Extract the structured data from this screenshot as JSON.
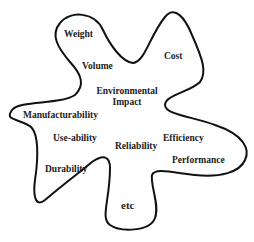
{
  "diagram": {
    "shape": "irregular-blob-outline",
    "stroke_color": "#111111",
    "labels": {
      "weight": "Weight",
      "cost": "Cost",
      "volume": "Volume",
      "environmental_impact_line1": "Environmental",
      "environmental_impact_line2": "Impact",
      "manufacturability": "Manufacturability",
      "use_ability": "Use-ability",
      "reliability": "Reliability",
      "efficiency": "Efficiency",
      "performance": "Performance",
      "durability": "Durability",
      "etc": "etc"
    }
  }
}
